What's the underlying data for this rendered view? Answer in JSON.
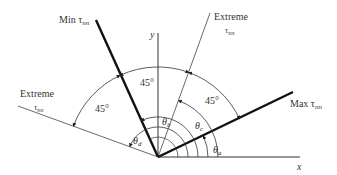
{
  "diagram": {
    "axes": {
      "x_label": "x",
      "y_label": "y"
    },
    "lines": [
      {
        "id": "max",
        "label": "Max",
        "symbol": "τ",
        "subscript": "nn",
        "angle_deg": 25,
        "weight": "bold"
      },
      {
        "id": "extreme_right",
        "label": "Extreme",
        "symbol": "τ",
        "subscript": "ns",
        "angle_deg": 70,
        "weight": "thin"
      },
      {
        "id": "min",
        "label": "Min",
        "symbol": "τ",
        "subscript": "nn",
        "angle_deg": 115,
        "weight": "bold"
      },
      {
        "id": "extreme_left",
        "label": "Extreme",
        "symbol": "τ",
        "subscript": "ns",
        "angle_deg": 160,
        "weight": "thin"
      }
    ],
    "angle_marks": [
      {
        "label": "45°",
        "between": "max / extreme_right"
      },
      {
        "label": "45°",
        "between": "extreme_right / min"
      },
      {
        "label": "45°",
        "between": "min / extreme_left"
      }
    ],
    "theta_labels": [
      {
        "symbol": "θ",
        "subscript": "a"
      },
      {
        "symbol": "θ",
        "subscript": "b"
      },
      {
        "symbol": "θ",
        "subscript": "c"
      },
      {
        "symbol": "θ",
        "subscript": "d"
      }
    ]
  }
}
